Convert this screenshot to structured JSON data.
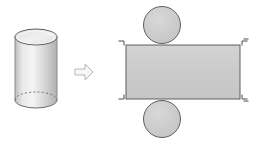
{
  "figure": {
    "title": "Cylinder and its net",
    "background_color": "#ffffff",
    "stroke_color": "#595959",
    "fill_color": "#cccccc",
    "arrow_outline_color": "#b3b3b3",
    "arrow_fill_color": "#f2f2f2",
    "corner_mark_color": "#4d4d4d"
  },
  "solid": {
    "name": "cylinder",
    "label": "cylinder",
    "center_x": 36,
    "top_y": 37,
    "bottom_y": 100,
    "radius_x": 21,
    "radius_y": 8,
    "height": 63,
    "fill_top": "#e6e6e6",
    "fill_body": "#d4d4d4",
    "hidden_edge_style": "dashed"
  },
  "arrow": {
    "name": "right-arrow",
    "label": "becomes",
    "direction": "right",
    "x": 75,
    "y": 64,
    "width": 18,
    "height": 16
  },
  "net": {
    "name": "cylinder-net",
    "label": "net of cylinder",
    "rectangle": {
      "label": "lateral surface",
      "x": 126,
      "y": 45,
      "width": 114,
      "height": 54
    },
    "circles": [
      {
        "label": "top base",
        "cx": 162,
        "cy": 25,
        "r": 19
      },
      {
        "label": "bottom base",
        "cx": 162,
        "cy": 119,
        "r": 19
      }
    ],
    "corner_marks": [
      {
        "label": "top-left-corner-mark",
        "x": 120,
        "y": 40,
        "orient": "tl"
      },
      {
        "label": "top-right-corner-mark",
        "x": 241,
        "y": 40,
        "orient": "tr"
      },
      {
        "label": "bottom-left-corner-mark",
        "x": 120,
        "y": 95,
        "orient": "bl"
      },
      {
        "label": "bottom-right-corner-mark",
        "x": 241,
        "y": 95,
        "orient": "br"
      }
    ]
  }
}
